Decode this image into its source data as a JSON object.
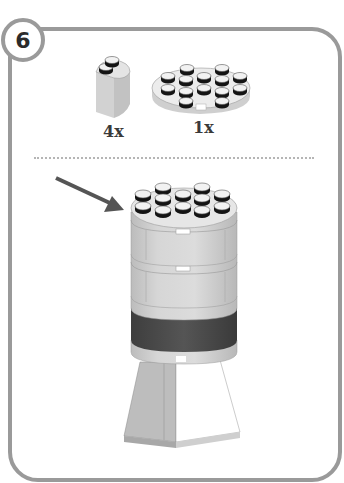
{
  "step": {
    "number": "6"
  },
  "parts": [
    {
      "name": "2x2 round corner brick",
      "quantity": "4x",
      "color": "#d9d9d9"
    },
    {
      "name": "4x4 round plate",
      "quantity": "1x",
      "color": "#e6e6e6"
    }
  ],
  "assembly": {
    "arrow_color": "#555555",
    "layers": [
      {
        "name": "top round plate",
        "color": "#e3e3e3"
      },
      {
        "name": "round brick layer 1",
        "color": "#cfcfcf"
      },
      {
        "name": "round brick layer 2",
        "color": "#cfcfcf"
      },
      {
        "name": "dark round brick layer",
        "color": "#4f4f4f"
      },
      {
        "name": "light round plate",
        "color": "#cfcfcf"
      },
      {
        "name": "slope base",
        "color": "#bdbdbd"
      }
    ]
  },
  "colors": {
    "frame": "#9a9a9a",
    "stud_dark": "#1a1a1a",
    "light_gray": "#d4d4d4",
    "dark_gray": "#4f4f4f"
  }
}
